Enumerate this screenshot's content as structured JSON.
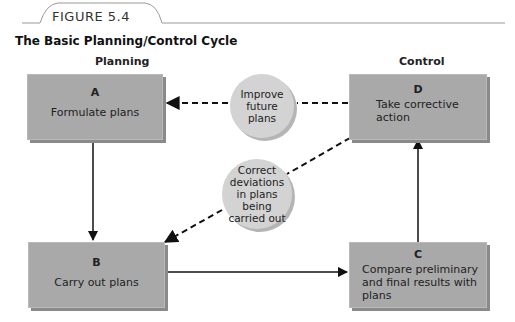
{
  "figure": {
    "label": "FIGURE 5.4",
    "title": "The Basic Planning/Control Cycle"
  },
  "columns": {
    "planning": "Planning",
    "control": "Control"
  },
  "boxes": {
    "a": {
      "letter": "A",
      "text": "Formulate plans"
    },
    "b": {
      "letter": "B",
      "text": "Carry out plans"
    },
    "c": {
      "letter": "C",
      "text": "Compare preliminary and final results with plans"
    },
    "d": {
      "letter": "D",
      "text": "Take corrective action"
    }
  },
  "circles": {
    "improve": "Improve future plans",
    "correct": "Correct deviations in plans being carried out"
  },
  "colors": {
    "box_fill": "#a9a9a9",
    "box_shadow": "#8a8a8a",
    "circle_fill": "#d3d3d3",
    "arrow": "#111111"
  }
}
